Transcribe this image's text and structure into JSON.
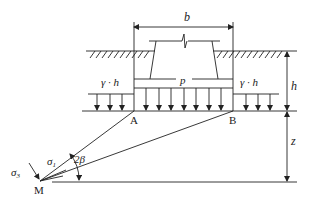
{
  "diagram": {
    "type": "foundation-stress-diagram",
    "labels": {
      "width": "b",
      "pressure": "p",
      "overburden_left": "γ · h",
      "overburden_right": "γ · h",
      "depth_h": "h",
      "depth_z": "z",
      "point_a": "A",
      "point_b": "B",
      "point_m": "M",
      "sigma_1": "σ",
      "sigma_1_sub": "1",
      "sigma_3": "σ",
      "sigma_3_sub": "3",
      "angle": "2β"
    },
    "colors": {
      "line": "#222222",
      "background": "#ffffff"
    }
  }
}
